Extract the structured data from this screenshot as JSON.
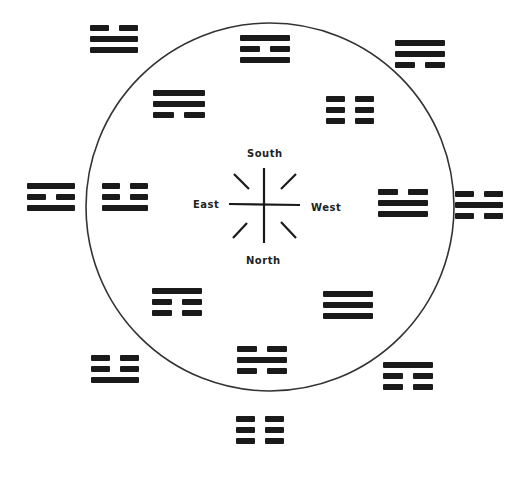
{
  "diagram": {
    "title": "",
    "circle": {
      "cx": 270,
      "cy": 207,
      "r": 184,
      "stroke": "#333333"
    },
    "compass": {
      "center": {
        "x": 265,
        "y": 205
      },
      "labels": {
        "south": "South",
        "north": "North",
        "east": "East",
        "west": "West"
      }
    },
    "trigrams": [
      {
        "id": "outer-top-left",
        "x": 90,
        "y": 25,
        "w": 48,
        "lines": [
          "broken",
          "solid",
          "solid"
        ]
      },
      {
        "id": "inner-top",
        "x": 240,
        "y": 35,
        "w": 50,
        "lines": [
          "solid",
          "broken",
          "solid"
        ]
      },
      {
        "id": "outer-top-right",
        "x": 395,
        "y": 40,
        "w": 50,
        "lines": [
          "solid",
          "solid",
          "broken"
        ]
      },
      {
        "id": "inner-upper-left",
        "x": 153,
        "y": 90,
        "w": 52,
        "lines": [
          "solid",
          "solid",
          "broken"
        ]
      },
      {
        "id": "inner-upper-right",
        "x": 326,
        "y": 96,
        "w": 48,
        "lines": [
          "broken",
          "broken",
          "broken"
        ]
      },
      {
        "id": "outer-left",
        "x": 27,
        "y": 183,
        "w": 48,
        "lines": [
          "solid",
          "broken",
          "solid"
        ]
      },
      {
        "id": "inner-left",
        "x": 102,
        "y": 183,
        "w": 46,
        "lines": [
          "broken",
          "broken",
          "solid"
        ]
      },
      {
        "id": "inner-right",
        "x": 378,
        "y": 189,
        "w": 50,
        "lines": [
          "broken",
          "solid",
          "solid"
        ]
      },
      {
        "id": "outer-right",
        "x": 455,
        "y": 191,
        "w": 48,
        "lines": [
          "broken",
          "solid",
          "broken"
        ]
      },
      {
        "id": "inner-lower-left",
        "x": 152,
        "y": 288,
        "w": 50,
        "lines": [
          "solid",
          "broken",
          "broken"
        ]
      },
      {
        "id": "inner-lower-right",
        "x": 323,
        "y": 291,
        "w": 50,
        "lines": [
          "solid",
          "solid",
          "solid"
        ]
      },
      {
        "id": "inner-bottom",
        "x": 237,
        "y": 346,
        "w": 50,
        "lines": [
          "broken",
          "solid",
          "broken"
        ]
      },
      {
        "id": "outer-bottom-left",
        "x": 91,
        "y": 355,
        "w": 48,
        "lines": [
          "broken",
          "broken",
          "solid"
        ]
      },
      {
        "id": "outer-bottom-right",
        "x": 383,
        "y": 362,
        "w": 50,
        "lines": [
          "solid",
          "broken",
          "broken"
        ]
      },
      {
        "id": "outer-bottom",
        "x": 236,
        "y": 416,
        "w": 48,
        "lines": [
          "broken",
          "broken",
          "broken"
        ]
      }
    ]
  }
}
